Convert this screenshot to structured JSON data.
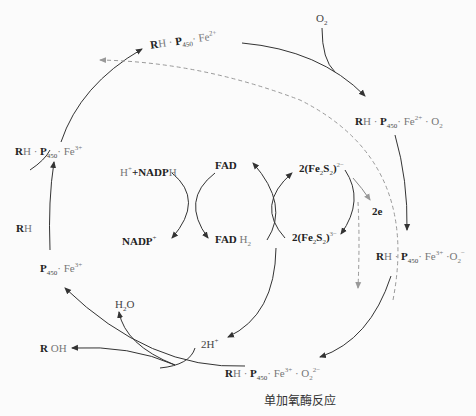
{
  "diagram": {
    "title": "单加氧酶反应",
    "cycle_states": [
      {
        "id": "s1",
        "label": "RH · P450 · Fe2+",
        "parts": {
          "bold1": "R",
          "text1": "H · ",
          "bold2": "P",
          "sub2": "450",
          "text2": "· Fe",
          "sup2": "2+"
        }
      },
      {
        "id": "s2",
        "label": "RH · P450 · Fe2+ · O2",
        "parts": {
          "bold1": "R",
          "text1": "H · ",
          "bold2": "P",
          "sub2": "450",
          "text2": "· Fe",
          "sup2": "2+",
          "text3": " · O",
          "sub3": "2"
        }
      },
      {
        "id": "s3",
        "label": "RH · P450 · Fe3+ ·O2-",
        "parts": {
          "bold1": "R",
          "text1": "H · ",
          "bold2": "P",
          "sub2": "450",
          "text2": "· Fe",
          "sup2": "3+",
          "text3": " ·O",
          "sub3": "2",
          "sup3": "−"
        }
      },
      {
        "id": "s4",
        "label": "RH · P450 · Fe3+ · O2 2-",
        "parts": {
          "bold1": "R",
          "text1": "H · ",
          "bold2": "P",
          "sub2": "450",
          "text2": "· Fe",
          "sup2": "3+",
          "text3": " · O",
          "sub3": "2",
          "sup3": "2−"
        }
      },
      {
        "id": "s5",
        "label": "P450 · Fe3+",
        "parts": {
          "bold2": "P",
          "sub2": "450",
          "text2": "· Fe",
          "sup2": "3+"
        }
      },
      {
        "id": "s6",
        "label": "RH · P450 · Fe3+",
        "parts": {
          "bold1": "R",
          "text1": "H · ",
          "bold2": "P",
          "sub2": "450",
          "text2": "· Fe",
          "sup2": "3+"
        }
      }
    ],
    "species": {
      "o2": {
        "text": "O",
        "sub": "2"
      },
      "rh": {
        "bold": "R",
        "text": "H"
      },
      "roh": {
        "bold": "R",
        "text": " OH"
      },
      "h2o": {
        "text": "H",
        "sub": "2",
        "text2": "O"
      },
      "two_h": {
        "text": "2H",
        "sup": "+"
      },
      "two_e": {
        "text": "2e"
      },
      "h_nadph": {
        "text": "H",
        "sup": "+",
        "bold": "+NADP",
        "text2": "H"
      },
      "nadp": {
        "bold": "NADP",
        "sup": "+"
      },
      "fad": {
        "bold": "FAD"
      },
      "fadh2": {
        "bold": "FAD",
        "text": " H",
        "sub": "2"
      },
      "fe2s2_top": {
        "bold": "2(Fe",
        "sub": "2",
        "bold2": "S",
        "sub2": "2",
        "bold3": ")",
        "sup": "2−"
      },
      "fe2s2_bot": {
        "bold": "2(Fe",
        "sub": "2",
        "bold2": "S",
        "sub2": "2",
        "bold3": ")",
        "sup": "3−"
      }
    },
    "colors": {
      "line": "#333333",
      "dashed": "#9a9a9a",
      "background": "#fbfbfb"
    }
  }
}
